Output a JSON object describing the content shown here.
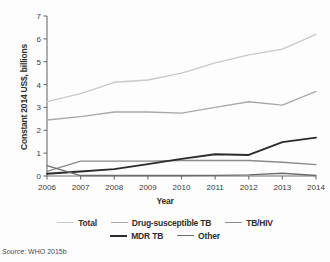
{
  "axes": {
    "ylabel": "Constant 2014 US$, billions",
    "xlabel": "Year",
    "yticks": [
      "0",
      "1",
      "2",
      "3",
      "4",
      "5",
      "6",
      "7"
    ],
    "xticks": [
      "2006",
      "2007",
      "2008",
      "2009",
      "2010",
      "2011",
      "2012",
      "2013",
      "2014"
    ]
  },
  "legend": {
    "row1": [
      {
        "label": "Total",
        "color": "#c9c9c9",
        "width": 1.6
      },
      {
        "label": "Drug-susceptible TB",
        "color": "#a8a8a8",
        "width": 1.6
      },
      {
        "label": "TB/HIV",
        "color": "#8a8a8a",
        "width": 1.6
      }
    ],
    "row2": [
      {
        "label": "MDR TB",
        "color": "#2b2b2b",
        "width": 2.0
      },
      {
        "label": "Other",
        "color": "#6e6e6e",
        "width": 1.6
      }
    ]
  },
  "source": {
    "prefix": "Source:",
    "text": "WHO 2015b"
  },
  "chart_data": {
    "type": "line",
    "title": "",
    "xlabel": "Year",
    "ylabel": "Constant 2014 US$, billions",
    "x": [
      2006,
      2007,
      2008,
      2009,
      2010,
      2011,
      2012,
      2013,
      2014
    ],
    "xlim": [
      2006,
      2014
    ],
    "ylim": [
      0,
      7
    ],
    "yticks": [
      0,
      1,
      2,
      3,
      4,
      5,
      6,
      7
    ],
    "grid": false,
    "legend_position": "bottom",
    "series": [
      {
        "name": "Total",
        "color": "#c9c9c9",
        "values": [
          3.25,
          3.6,
          4.1,
          4.2,
          4.5,
          4.95,
          5.3,
          5.55,
          6.2
        ]
      },
      {
        "name": "Drug-susceptible TB",
        "color": "#a8a8a8",
        "values": [
          2.45,
          2.6,
          2.8,
          2.8,
          2.75,
          3.0,
          3.25,
          3.1,
          3.7
        ]
      },
      {
        "name": "TB/HIV",
        "color": "#8a8a8a",
        "values": [
          0.2,
          0.65,
          0.65,
          0.65,
          0.68,
          0.68,
          0.68,
          0.6,
          0.5
        ]
      },
      {
        "name": "MDR TB",
        "color": "#2b2b2b",
        "values": [
          0.1,
          0.2,
          0.3,
          0.52,
          0.75,
          0.95,
          0.92,
          1.48,
          1.68
        ]
      },
      {
        "name": "Other",
        "color": "#6e6e6e",
        "values": [
          0.45,
          0.02,
          0.02,
          0.02,
          0.02,
          0.03,
          0.05,
          0.12,
          0.02
        ]
      }
    ]
  }
}
